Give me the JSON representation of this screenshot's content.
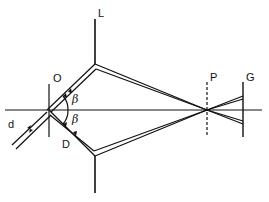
{
  "diagram": {
    "type": "optical-interferometer-schematic",
    "labels": {
      "L": "L",
      "O": "O",
      "P": "P",
      "G": "G",
      "D": "D",
      "d": "d",
      "beta_upper": "β",
      "beta_lower": "β"
    },
    "colors": {
      "line": "#111111",
      "background": "#ffffff"
    },
    "elements": [
      {
        "name": "optical-axis",
        "description": "horizontal reference line"
      },
      {
        "name": "object-plane-O",
        "description": "vertical line at O"
      },
      {
        "name": "mirror-L",
        "description": "vertical mirror top"
      },
      {
        "name": "mirror-bottom",
        "description": "vertical mirror bottom"
      },
      {
        "name": "plane-P",
        "description": "dashed vertical plane"
      },
      {
        "name": "screen-G",
        "description": "vertical screen line"
      }
    ]
  }
}
